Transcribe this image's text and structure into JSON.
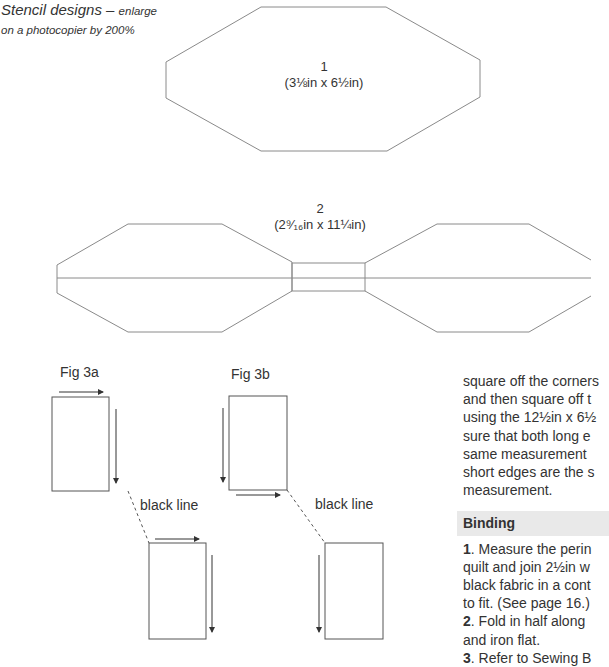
{
  "caption": {
    "title": "Stencil designs",
    "dash": " – ",
    "subtitle_line1": "enlarge",
    "subtitle_line2": "on a photocopier by 200%"
  },
  "stencils": [
    {
      "number": "1",
      "size": "(3⅛in x 6½in)"
    },
    {
      "number": "2",
      "size": "(2⁹⁄₁₆in x 11¼in)"
    }
  ],
  "figures": {
    "fig3a": {
      "title": "Fig 3a",
      "line_label": "black line"
    },
    "fig3b": {
      "title": "Fig 3b",
      "line_label": "black line"
    }
  },
  "text_column": {
    "paragraph_lines": [
      "square off the corners",
      "and then square off t",
      "using the 12½in x 6½",
      "sure that both long e",
      "same measurement",
      "short edges are the s",
      "measurement."
    ],
    "binding_heading": "Binding",
    "steps": [
      {
        "num": "1",
        "lines": [
          ". Measure the perin",
          "quilt and join 2½in w",
          "black fabric in a cont",
          "to fit. (See page 16.)"
        ]
      },
      {
        "num": "2",
        "lines": [
          ". Fold in half along",
          "and iron flat."
        ]
      },
      {
        "num": "3",
        "lines": [
          ". Refer to Sewing B"
        ]
      }
    ]
  },
  "colors": {
    "line": "#8a8a8a",
    "text": "#333333",
    "heading_bg": "#e9e9e9"
  }
}
